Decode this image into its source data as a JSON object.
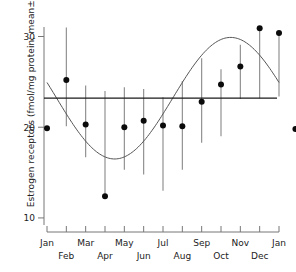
{
  "chart_data": {
    "type": "scatter",
    "title": "",
    "xlabel": "",
    "ylabel": "Estrogen receptors (fmol/mg protein; mean±SE)",
    "xlim": [
      0,
      12
    ],
    "ylim": [
      9.0,
      31.6
    ],
    "grid": false,
    "legend": "none",
    "y_ticks": [
      10,
      20,
      30
    ],
    "y_tick_labels": [
      "10",
      "20",
      "30"
    ],
    "x_ticks": [
      0,
      1,
      2,
      3,
      4,
      5,
      6,
      7,
      8,
      9,
      10,
      11,
      12
    ],
    "x_tick_labels": [
      "Jan",
      "Feb",
      "Mar",
      "Apr",
      "May",
      "Jun",
      "Jul",
      "Aug",
      "Sep",
      "Oct",
      "Nov",
      "Dec",
      "Jan"
    ],
    "x_tick_label_rows": [
      0,
      1,
      0,
      1,
      0,
      1,
      0,
      1,
      0,
      1,
      0,
      1,
      0
    ],
    "categories": [
      "Jan",
      "Feb",
      "Mar",
      "Apr",
      "May",
      "Jun",
      "Jul",
      "Aug",
      "Sep",
      "Oct",
      "Nov",
      "Dec",
      "Jan"
    ],
    "values": [
      19.9,
      25.2,
      20.3,
      12.4,
      20.0,
      20.7,
      20.2,
      20.1,
      22.8,
      24.7,
      26.7,
      30.9,
      30.4
    ],
    "errors_upper": [
      19.9,
      31.0,
      24.6,
      24.0,
      24.4,
      24.2,
      23.3,
      25.1,
      27.6,
      26.4,
      29.1,
      30.9,
      30.4
    ],
    "errors_lower": [
      19.9,
      20.1,
      16.7,
      12.4,
      15.3,
      14.8,
      13.0,
      15.3,
      18.3,
      19.0,
      23.1,
      23.2,
      23.4
    ],
    "extra_points": [
      {
        "x": 12.85,
        "y": 19.8,
        "label": "Jan (following year)"
      }
    ],
    "mean_line": {
      "value": 23.2,
      "label": "overall mean",
      "style": "solid"
    },
    "fitted_curve": {
      "type": "sinusoid",
      "equation": "y = 23.2 + 6.7 * sin(2*pi*(month - 6.5)/12)",
      "mean": 23.2,
      "amplitude": 6.7,
      "period_months": 12,
      "phase_month_of_minimum": 3.5,
      "phase_month_of_maximum": 9.5
    }
  },
  "axes": {
    "y_axis_title": "Estrogen receptors (fmol/mg protein; mean±SE)",
    "y_labels": {
      "top": "30",
      "mid": "20",
      "bottom": "10"
    },
    "x_labels_row_top": [
      "Jan",
      "Mar",
      "May",
      "Jul",
      "Sep",
      "Nov",
      "Jan"
    ],
    "x_labels_row_bottom": [
      "Feb",
      "Apr",
      "Jun",
      "Aug",
      "Oct",
      "Dec"
    ]
  },
  "colors": {
    "point": "#0b0b0b",
    "error_bar": "#888888",
    "mean_line": "#1a1a1a",
    "fit_curve": "#555555",
    "axis": "#777777",
    "text": "#222222",
    "background": "#ffffff"
  }
}
